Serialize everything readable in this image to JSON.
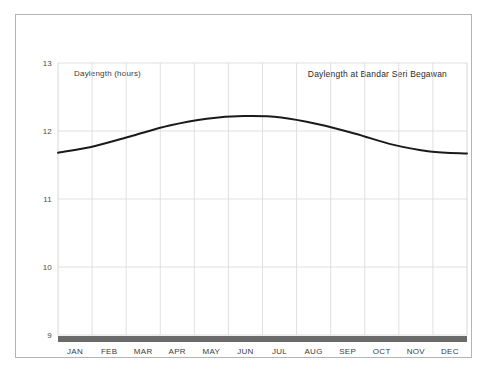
{
  "chart_data": {
    "type": "line",
    "title": "Daylength at Bandar Seri Begawan",
    "ylabel": "Daylength (hours)",
    "xlabel": "",
    "categories": [
      "JAN",
      "FEB",
      "MAR",
      "APR",
      "MAY",
      "JUN",
      "JUL",
      "AUG",
      "SEP",
      "OCT",
      "NOV",
      "DEC"
    ],
    "x_tick_labels": [
      "JAN",
      "FEB",
      "MAR",
      "APR",
      "MAY",
      "JUN",
      "JUL",
      "AUG",
      "SEP",
      "OCT",
      "NOV",
      "DEC"
    ],
    "y_tick_labels": [
      "13",
      "12",
      "11",
      "10",
      "9"
    ],
    "y_ticks": [
      13,
      12,
      11,
      10,
      9
    ],
    "ylim": [
      9,
      13
    ],
    "xlim": [
      0,
      12
    ],
    "grid": true,
    "legend": "none",
    "line_color": "#1a1a1a",
    "grid_color": "#d8d8d8",
    "series": [
      {
        "name": "Daylength (hours)",
        "values": [
          11.68,
          11.78,
          11.93,
          12.08,
          12.18,
          12.22,
          12.2,
          12.1,
          11.96,
          11.8,
          11.7,
          11.67
        ],
        "x_fractions": [
          0,
          0.0909,
          0.1818,
          0.2727,
          0.3636,
          0.4545,
          0.5455,
          0.6364,
          0.7273,
          0.8182,
          0.9091,
          1.0
        ]
      }
    ]
  }
}
